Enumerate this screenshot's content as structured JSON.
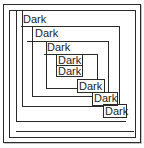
{
  "window": {
    "kind": "nested-frames-demo",
    "background": "#ffffff"
  },
  "colors": {
    "line": "#2a2a2a",
    "text": "#1d1d1d",
    "shadow": "#c4c4c4",
    "background": "#ffffff"
  },
  "labels": [
    {
      "text": "Dark",
      "x": 23,
      "y": 14
    },
    {
      "text": "Dark",
      "x": 35,
      "y": 28
    },
    {
      "text": "Dark",
      "x": 47,
      "y": 42
    },
    {
      "text": "Dark",
      "x": 58,
      "y": 55
    },
    {
      "text": "Dark",
      "x": 58,
      "y": 66
    },
    {
      "text": "Dark",
      "x": 79,
      "y": 81
    },
    {
      "text": "Dark",
      "x": 94,
      "y": 93
    },
    {
      "text": "Dark",
      "x": 105,
      "y": 106
    }
  ],
  "segments": [
    {
      "x": 16,
      "y": 10,
      "w": 1,
      "h": 111
    },
    {
      "x": 22,
      "y": 10,
      "w": 1,
      "h": 96
    },
    {
      "x": 32,
      "y": 26,
      "w": 1,
      "h": 70
    },
    {
      "x": 46,
      "y": 41,
      "w": 1,
      "h": 47
    },
    {
      "x": 21,
      "y": 26,
      "w": 99,
      "h": 1
    },
    {
      "x": 27,
      "y": 41,
      "w": 82,
      "h": 1
    },
    {
      "x": 44,
      "y": 54,
      "w": 54,
      "h": 1
    },
    {
      "x": 119,
      "y": 26,
      "w": 1,
      "h": 78
    },
    {
      "x": 108,
      "y": 41,
      "w": 1,
      "h": 51
    },
    {
      "x": 97,
      "y": 54,
      "w": 1,
      "h": 26
    },
    {
      "x": 46,
      "y": 88,
      "w": 32,
      "h": 1
    },
    {
      "x": 32,
      "y": 96,
      "w": 61,
      "h": 1
    },
    {
      "x": 22,
      "y": 106,
      "w": 82,
      "h": 1
    },
    {
      "x": 16,
      "y": 121,
      "w": 110,
      "h": 1
    },
    {
      "x": 16,
      "y": 131,
      "w": 118,
      "h": 1
    }
  ],
  "boxes": [
    {
      "x": 56,
      "y": 54,
      "w": 27,
      "h": 12
    },
    {
      "x": 56,
      "y": 65,
      "w": 27,
      "h": 12
    },
    {
      "x": 77,
      "y": 79,
      "w": 28,
      "h": 14
    },
    {
      "x": 92,
      "y": 92,
      "w": 26,
      "h": 14
    },
    {
      "x": 103,
      "y": 104,
      "w": 24,
      "h": 14
    }
  ]
}
